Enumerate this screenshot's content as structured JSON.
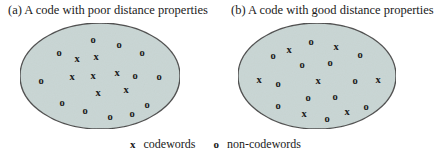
{
  "panels": [
    {
      "id": "a",
      "title": "(a) A code with poor distance properties",
      "ellipse": {
        "cx": 100,
        "cy": 76,
        "rx": 80,
        "ry": 53
      },
      "points": [
        {
          "s": "o",
          "x": 93,
          "y": 39
        },
        {
          "s": "o",
          "x": 119,
          "y": 44
        },
        {
          "s": "o",
          "x": 59,
          "y": 52
        },
        {
          "s": "o",
          "x": 142,
          "y": 52
        },
        {
          "s": "x",
          "x": 77,
          "y": 58
        },
        {
          "s": "x",
          "x": 96,
          "y": 56
        },
        {
          "s": "o",
          "x": 41,
          "y": 80
        },
        {
          "s": "x",
          "x": 72,
          "y": 76
        },
        {
          "s": "x",
          "x": 93,
          "y": 75
        },
        {
          "s": "x",
          "x": 117,
          "y": 72
        },
        {
          "s": "o",
          "x": 135,
          "y": 75
        },
        {
          "s": "o",
          "x": 159,
          "y": 76
        },
        {
          "s": "x",
          "x": 98,
          "y": 92
        },
        {
          "s": "x",
          "x": 126,
          "y": 89
        },
        {
          "s": "o",
          "x": 62,
          "y": 102
        },
        {
          "s": "o",
          "x": 147,
          "y": 104
        },
        {
          "s": "o",
          "x": 85,
          "y": 110
        },
        {
          "s": "o",
          "x": 132,
          "y": 113
        },
        {
          "s": "o",
          "x": 110,
          "y": 116
        }
      ]
    },
    {
      "id": "b",
      "title": "(b) A code with good distance properties",
      "ellipse": {
        "cx": 317,
        "cy": 76,
        "rx": 79,
        "ry": 53
      },
      "points": [
        {
          "s": "o",
          "x": 311,
          "y": 41
        },
        {
          "s": "x",
          "x": 289,
          "y": 49
        },
        {
          "s": "x",
          "x": 336,
          "y": 46
        },
        {
          "s": "o",
          "x": 273,
          "y": 55
        },
        {
          "s": "o",
          "x": 360,
          "y": 54
        },
        {
          "s": "o",
          "x": 302,
          "y": 64
        },
        {
          "s": "o",
          "x": 330,
          "y": 62
        },
        {
          "s": "x",
          "x": 259,
          "y": 79
        },
        {
          "s": "o",
          "x": 278,
          "y": 83
        },
        {
          "s": "x",
          "x": 318,
          "y": 80
        },
        {
          "s": "o",
          "x": 355,
          "y": 80
        },
        {
          "s": "x",
          "x": 378,
          "y": 79
        },
        {
          "s": "o",
          "x": 308,
          "y": 97
        },
        {
          "s": "o",
          "x": 335,
          "y": 96
        },
        {
          "s": "o",
          "x": 278,
          "y": 105
        },
        {
          "s": "o",
          "x": 366,
          "y": 106
        },
        {
          "s": "x",
          "x": 304,
          "y": 113
        },
        {
          "s": "x",
          "x": 347,
          "y": 111
        },
        {
          "s": "o",
          "x": 327,
          "y": 118
        }
      ]
    }
  ],
  "legend": [
    {
      "symbol": "x",
      "label": "codewords"
    },
    {
      "symbol": "o",
      "label": "non-codewords"
    }
  ],
  "colors": {
    "ellipse_fill": "#c9d6d4",
    "ellipse_stroke": "#4a4a4a",
    "symbol": "#1a1a1a"
  }
}
